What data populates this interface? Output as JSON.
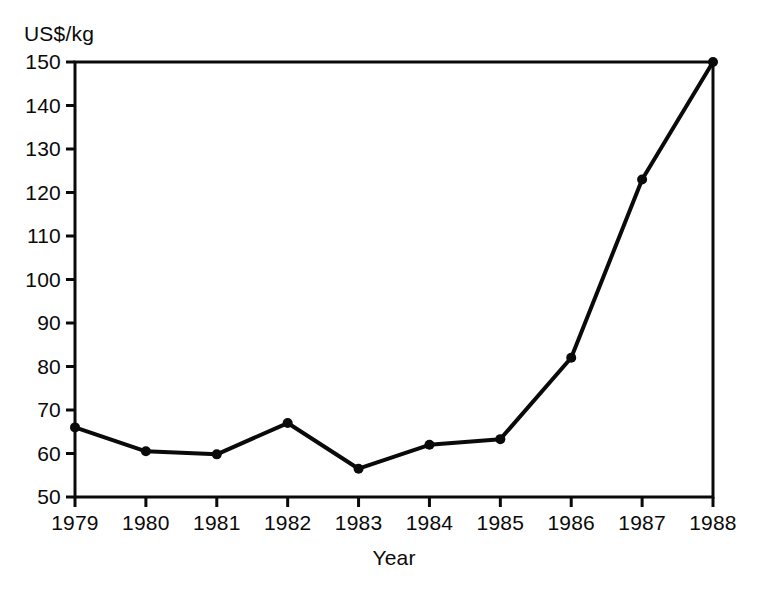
{
  "chart_data": {
    "type": "line",
    "title": "",
    "subtitle": "",
    "xlabel": "Year",
    "ylabel": "US$/kg",
    "ylabel_position": "above-axis",
    "categories": [
      1979,
      1980,
      1981,
      1982,
      1983,
      1984,
      1985,
      1986,
      1987,
      1988
    ],
    "x_tick_labels": [
      "1979",
      "1980",
      "1981",
      "1982",
      "1983",
      "1984",
      "1985",
      "1986",
      "1987",
      "1988"
    ],
    "values": [
      66,
      60.5,
      59.8,
      67,
      56.5,
      62,
      63.3,
      82,
      123,
      150
    ],
    "y_tick_labels": [
      "50",
      "60",
      "70",
      "80",
      "90",
      "100",
      "110",
      "120",
      "130",
      "140",
      "150"
    ],
    "y_ticks": [
      50,
      60,
      70,
      80,
      90,
      100,
      110,
      120,
      130,
      140,
      150
    ],
    "ylim": [
      50,
      150
    ],
    "xlim": [
      1979,
      1988
    ],
    "grid": false,
    "legend": null,
    "legend_position": "none",
    "annotations": [],
    "series_style": {
      "line_color": "#0a0a0a",
      "line_width": 4,
      "marker": "circle",
      "marker_color": "#0a0a0a",
      "marker_size": 5
    },
    "axis_style": {
      "frame": "box",
      "axis_color": "#0a0a0a",
      "tick_direction": "out",
      "background": "#ffffff"
    }
  }
}
